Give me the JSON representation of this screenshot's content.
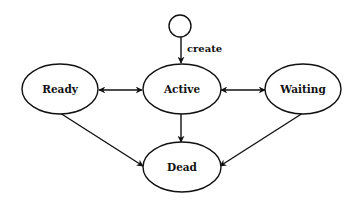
{
  "diagram": {
    "type": "state-diagram",
    "colors": {
      "stroke": "#111111",
      "fill": "#ffffff",
      "text": "#111111"
    },
    "nodes": {
      "start": {
        "id": "start",
        "kind": "initial-state",
        "label": ""
      },
      "ready": {
        "id": "ready",
        "kind": "state",
        "label": "Ready"
      },
      "active": {
        "id": "active",
        "kind": "state",
        "label": "Active"
      },
      "waiting": {
        "id": "waiting",
        "kind": "state",
        "label": "Waiting"
      },
      "dead": {
        "id": "dead",
        "kind": "state",
        "label": "Dead"
      }
    },
    "edges": {
      "start_active": {
        "from": "start",
        "to": "active",
        "label": "create",
        "direction": "forward"
      },
      "ready_active": {
        "from": "ready",
        "to": "active",
        "label": "",
        "direction": "bidirectional"
      },
      "active_waiting": {
        "from": "active",
        "to": "waiting",
        "label": "",
        "direction": "bidirectional"
      },
      "active_dead": {
        "from": "active",
        "to": "dead",
        "label": "",
        "direction": "forward"
      },
      "ready_dead": {
        "from": "ready",
        "to": "dead",
        "label": "",
        "direction": "forward"
      },
      "waiting_dead": {
        "from": "waiting",
        "to": "dead",
        "label": "",
        "direction": "forward"
      }
    }
  }
}
